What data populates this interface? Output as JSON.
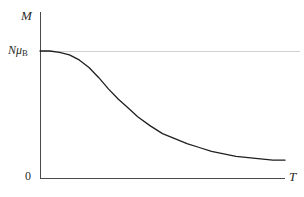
{
  "figure": {
    "kind": "physics-plot",
    "background_color": "#ffffff",
    "axis_color": "#4a4a4a",
    "curve_color": "#1f1f1f",
    "guide_color": "#d0d0d0",
    "label_color": "#2b2b2b"
  },
  "labels": {
    "y_axis_title": "M",
    "x_axis_title": "T",
    "y_tick_saturation_prefix": "N",
    "y_tick_saturation_mu": "μ",
    "y_tick_saturation_sub": "B",
    "y_tick_zero": "0"
  },
  "chart_data": {
    "type": "line",
    "title": "",
    "xlabel": "T",
    "ylabel": "M",
    "grid": false,
    "legend": null,
    "xlim": [
      0,
      1
    ],
    "ylim": [
      0,
      1.12
    ],
    "xticks": [
      0
    ],
    "xticklabels": [
      ""
    ],
    "yticks": [
      0,
      1
    ],
    "yticklabels": [
      "0",
      "NμB"
    ],
    "annotations": [
      {
        "type": "hline",
        "y": 1.0,
        "label": "NμB saturation level",
        "color": "#d0d0d0",
        "x_start": 0,
        "x_end": 1
      }
    ],
    "series": [
      {
        "name": "Magnetization M(T)",
        "x": [
          0.0,
          0.04,
          0.08,
          0.12,
          0.16,
          0.2,
          0.24,
          0.28,
          0.32,
          0.36,
          0.4,
          0.45,
          0.5,
          0.55,
          0.6,
          0.65,
          0.7,
          0.75,
          0.8,
          0.85,
          0.9,
          0.95,
          1.0
        ],
        "y": [
          1.0,
          1.0,
          0.99,
          0.97,
          0.93,
          0.87,
          0.79,
          0.7,
          0.62,
          0.55,
          0.48,
          0.41,
          0.35,
          0.31,
          0.27,
          0.24,
          0.21,
          0.19,
          0.17,
          0.16,
          0.15,
          0.14,
          0.14
        ]
      }
    ]
  },
  "geometry": {
    "origin_x": 40,
    "origin_y": 178,
    "y_axis_top": 12,
    "x_axis_right": 285,
    "saturation_y": 51,
    "guide_line_right": 300,
    "curve_points": "40,51 52,51 60,52 68,55 76,60 84,68 92,78 100,89 110,101 120,112 130,121 140,128 150,134 160,139 170,143 180,146 192,150 204,153 216,155 228,157 240,158 256,159 270,160 285,160"
  }
}
